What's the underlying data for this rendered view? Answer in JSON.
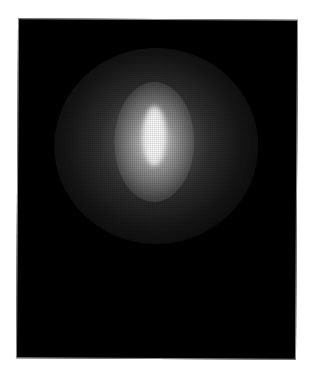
{
  "image": {
    "subject": "elliptical-galaxy-glow",
    "description": "Grayscale photograph of a diffuse bright elliptical glow on a black background",
    "colors": {
      "background": "#000000",
      "core": "#ffffff",
      "page": "#ffffff"
    }
  }
}
